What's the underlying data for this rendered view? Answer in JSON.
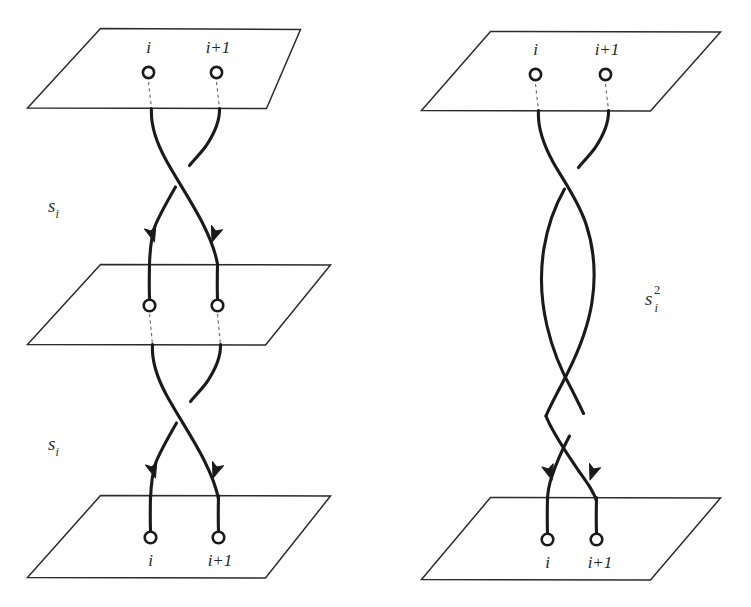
{
  "figure": {
    "background_color": "#ffffff",
    "stroke_color": "#1a1a1a",
    "plane_color": "#2b2b2b",
    "dashed_color": "#6f6f6f",
    "width": 751,
    "height": 607
  },
  "labels": {
    "strand_i": "i",
    "strand_i_plus_1": "i+1",
    "generator_s": "s",
    "generator_sub": "i",
    "generator_sup": "2"
  },
  "panels": [
    {
      "id": "left-panel",
      "name": "si-squared-as-two-si-steps",
      "description": "Three stacked planes joined by two single-crossing braid segments",
      "plane_count": 3,
      "crossing_count": 2,
      "generator_labels": [
        "s_i",
        "s_i"
      ],
      "planes": [
        {
          "id": "left-plane-top",
          "name": "top-plane",
          "node_labels": [
            "i",
            "i+1"
          ],
          "label_position": "above-nodes"
        },
        {
          "id": "left-plane-middle",
          "name": "middle-plane",
          "node_labels": [
            "i",
            "i+1"
          ],
          "label_position": "none"
        },
        {
          "id": "left-plane-bottom",
          "name": "bottom-plane",
          "node_labels": [
            "i",
            "i+1"
          ],
          "label_position": "below-nodes"
        }
      ],
      "segments": [
        {
          "id": "left-segment-upper",
          "name": "upper-braid-segment",
          "generator": "s",
          "generator_subscript": "i",
          "crossings": 1,
          "over_strand": "left",
          "arrow_direction": "down"
        },
        {
          "id": "left-segment-lower",
          "name": "lower-braid-segment",
          "generator": "s",
          "generator_subscript": "i",
          "crossings": 1,
          "over_strand": "left",
          "arrow_direction": "down"
        }
      ]
    },
    {
      "id": "right-panel",
      "name": "si-squared-single-step",
      "description": "Two planes joined by a double-crossing braid segment",
      "plane_count": 2,
      "crossing_count": 2,
      "generator_labels": [
        "s_i^2"
      ],
      "planes": [
        {
          "id": "right-plane-top",
          "name": "top-plane",
          "node_labels": [
            "i",
            "i+1"
          ],
          "label_position": "above-nodes"
        },
        {
          "id": "right-plane-bottom",
          "name": "bottom-plane",
          "node_labels": [
            "i",
            "i+1"
          ],
          "label_position": "below-nodes"
        }
      ],
      "segments": [
        {
          "id": "right-segment",
          "name": "double-crossing-braid-segment",
          "generator": "s",
          "generator_subscript": "i",
          "generator_superscript": "2",
          "crossings": 2,
          "over_strand": "left",
          "arrow_direction": "down"
        }
      ]
    }
  ]
}
